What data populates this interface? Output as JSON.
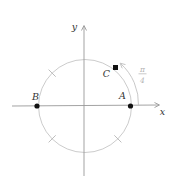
{
  "figure": {
    "labels": {
      "x_axis": "x",
      "y_axis": "y",
      "point_a": "A",
      "point_b": "B",
      "point_c": "C"
    },
    "angle": {
      "numerator": "π",
      "denominator": "4",
      "value": "π/4"
    },
    "colors": {
      "axis": "#999999",
      "circle": "#cccccc",
      "annotation": "#c2c2c2",
      "tick": "#b5b5b5",
      "marker": "#111111",
      "label": "#333333",
      "fraction": "#b3b3b3"
    },
    "geometry": {
      "center_x": 85,
      "center_y": 106,
      "radius": 46.5,
      "point_a_angle_deg": 0,
      "point_b_angle_deg": 180,
      "point_c_angle_deg": 50,
      "tick_angles_deg": [
        135,
        225,
        315
      ],
      "arc_from_deg": 0,
      "arc_to_deg": 50
    }
  }
}
